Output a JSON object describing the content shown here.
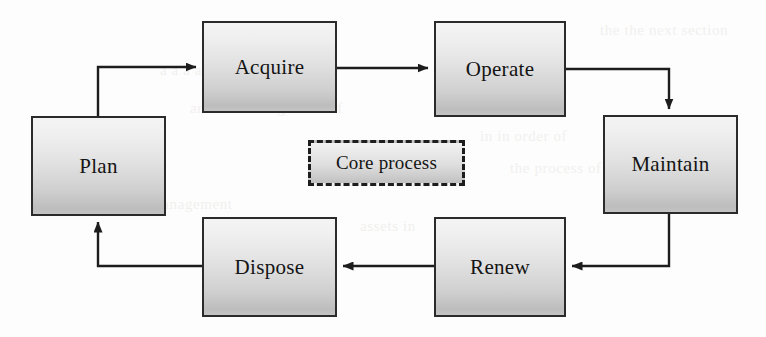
{
  "diagram": {
    "type": "cycle-flowchart",
    "canvas": {
      "width": 766,
      "height": 337,
      "background": "#fdfdfd"
    },
    "style": {
      "node_border_color": "#2b2b2b",
      "node_fill_top": "#f4f4f4",
      "node_fill_bottom": "#bdbdbd",
      "arrow_color": "#1d1d1d",
      "text_color": "#141414"
    },
    "nodes": [
      {
        "id": "plan",
        "label": "Plan",
        "x": 31,
        "y": 116,
        "w": 135,
        "h": 100
      },
      {
        "id": "acquire",
        "label": "Acquire",
        "x": 202,
        "y": 21,
        "w": 135,
        "h": 92
      },
      {
        "id": "operate",
        "label": "Operate",
        "x": 434,
        "y": 21,
        "w": 132,
        "h": 96
      },
      {
        "id": "maintain",
        "label": "Maintain",
        "x": 603,
        "y": 115,
        "w": 135,
        "h": 99
      },
      {
        "id": "renew",
        "label": "Renew",
        "x": 434,
        "y": 217,
        "w": 132,
        "h": 100
      },
      {
        "id": "dispose",
        "label": "Dispose",
        "x": 202,
        "y": 217,
        "w": 135,
        "h": 100
      }
    ],
    "legend": {
      "id": "core-process",
      "label": "Core process",
      "x": 308,
      "y": 140,
      "w": 157,
      "h": 46,
      "border_style": "dashed"
    },
    "edges": [
      {
        "from": "plan",
        "to": "acquire",
        "direction": "up-then-right"
      },
      {
        "from": "acquire",
        "to": "operate",
        "direction": "right"
      },
      {
        "from": "operate",
        "to": "maintain",
        "direction": "right-then-down"
      },
      {
        "from": "maintain",
        "to": "renew",
        "direction": "down-then-left"
      },
      {
        "from": "renew",
        "to": "dispose",
        "direction": "left"
      },
      {
        "from": "dispose",
        "to": "plan",
        "direction": "left-then-up"
      }
    ],
    "ghost_artifacts": [
      {
        "text": "the the next section",
        "x": 600,
        "y": 22
      },
      {
        "text": "a a a a a a a a a",
        "x": 160,
        "y": 62
      },
      {
        "text": "and the management of",
        "x": 190,
        "y": 100
      },
      {
        "text": "in in order of",
        "x": 480,
        "y": 128
      },
      {
        "text": "the process of",
        "x": 510,
        "y": 160
      },
      {
        "text": "management",
        "x": 150,
        "y": 196
      },
      {
        "text": "assets in",
        "x": 360,
        "y": 218
      }
    ]
  }
}
